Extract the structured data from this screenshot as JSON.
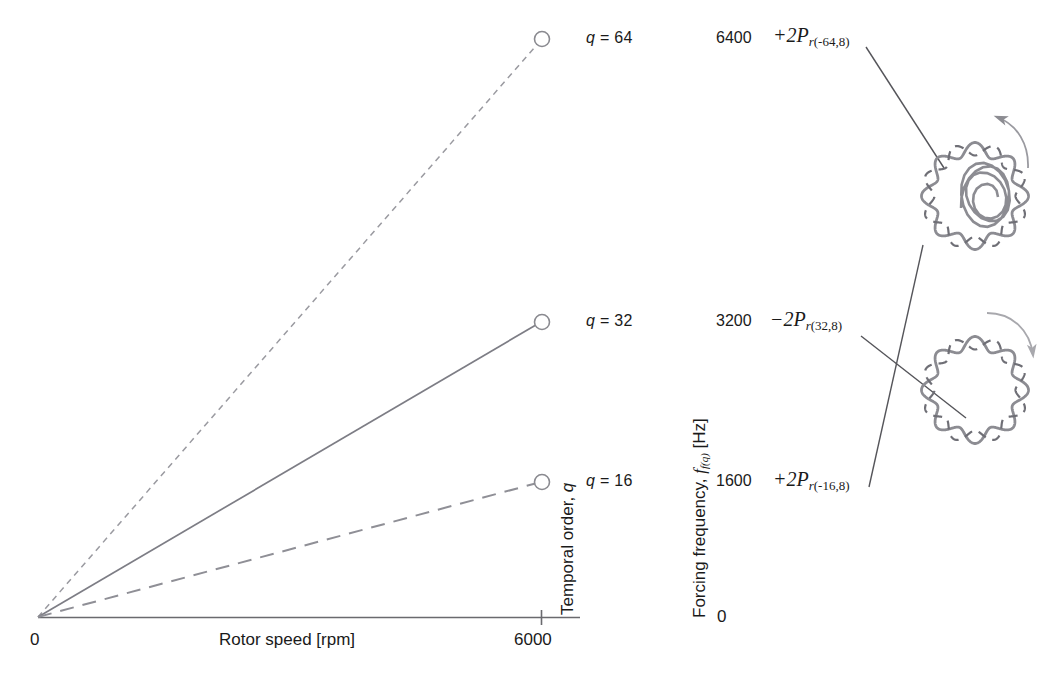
{
  "figure": {
    "x_axis": {
      "title": "Rotor speed [rpm]",
      "min_label": "0",
      "max_label": "6000",
      "min": 0,
      "max": 6000
    },
    "y_axis_order": {
      "title": "Temporal order, q"
    },
    "y_axis_freq": {
      "title_main": "Forcing frequency, ",
      "title_sym": "f",
      "title_sub": "f(q)",
      "title_unit": " [Hz]",
      "zero_label": "0"
    }
  },
  "rows": [
    {
      "q_label": "q = 64",
      "q_prefix": "q",
      "q_value": " = 64",
      "freq_label": "6400",
      "force_sign": "+2",
      "force_sym": "P",
      "force_sub_r": "r",
      "force_sub_args": "(-64,8)"
    },
    {
      "q_label": "q = 32",
      "q_prefix": "q",
      "q_value": " = 32",
      "freq_label": "3200",
      "force_sign": "−2",
      "force_sym": "P",
      "force_sub_r": "r",
      "force_sub_args": "(32,8)"
    },
    {
      "q_label": "q = 16",
      "q_prefix": "q",
      "q_value": " = 16",
      "freq_label": "1600",
      "force_sign": "+2",
      "force_sym": "P",
      "force_sub_r": "r",
      "force_sub_args": "(-16,8)"
    }
  ],
  "mode_shapes": [
    {
      "name": "upper-mode-shape",
      "lobes": 8,
      "rotation": "counter-clockwise"
    },
    {
      "name": "lower-mode-shape",
      "lobes": 8,
      "rotation": "clockwise"
    }
  ],
  "colors": {
    "line": "#8a8a90",
    "solid_line": "#7d7d85",
    "axis": "#555558",
    "text": "#1a1a1a",
    "mode": "#8c8c92",
    "leader": "#4a4a4e",
    "marker_fill": "#ffffff"
  },
  "chart_data": {
    "type": "line",
    "title": "",
    "xlabel": "Rotor speed [rpm]",
    "ylabel": "Forcing frequency, f_f(q) [Hz]",
    "xlim": [
      0,
      6000
    ],
    "ylim": [
      0,
      6400
    ],
    "grid": false,
    "legend": "right-labels",
    "x": [
      0,
      6000
    ],
    "series": [
      {
        "name": "q = 64",
        "q": 64,
        "values": [
          0,
          6400
        ],
        "style": "dotted",
        "endpoint_marker": "open-circle",
        "end_frequency": 6400
      },
      {
        "name": "q = 32",
        "q": 32,
        "values": [
          0,
          3200
        ],
        "style": "solid",
        "endpoint_marker": "open-circle",
        "end_frequency": 3200
      },
      {
        "name": "q = 16",
        "q": 16,
        "values": [
          0,
          1600
        ],
        "style": "dashed",
        "endpoint_marker": "open-circle",
        "end_frequency": 1600
      }
    ],
    "xtick_labels": [
      "0",
      "6000"
    ],
    "ytick_labels": [
      "0",
      "1600",
      "3200",
      "6400"
    ],
    "annotations": [
      "+2P_r(-64,8)",
      "−2P_r(32,8)",
      "+2P_r(-16,8)"
    ]
  }
}
